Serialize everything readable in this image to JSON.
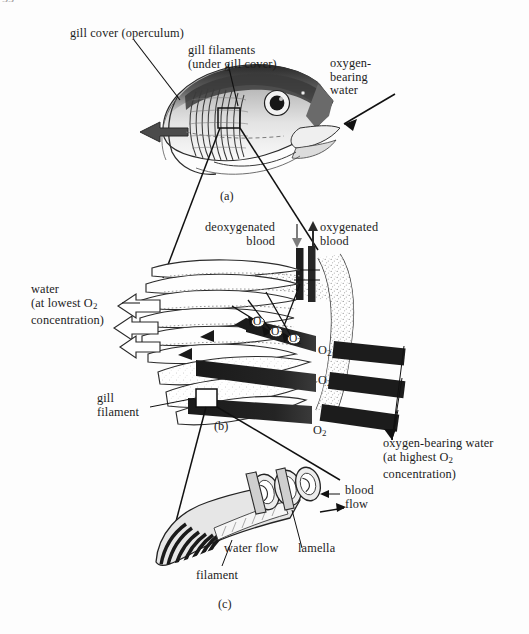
{
  "figure": {
    "page_artifact": "55",
    "background_color": "#fdfdfd",
    "ink_color": "#1a1a1a"
  },
  "panels": [
    {
      "id": "a",
      "caption": "(a)",
      "subject": "fish head with gill cover and gill filaments"
    },
    {
      "id": "b",
      "caption": "(b)",
      "subject": "gill arch with filaments and blood vessels"
    },
    {
      "id": "c",
      "caption": "(c)",
      "subject": "single gill filament with lamellae"
    }
  ],
  "labels": {
    "gill_cover": "gill cover (operculum)",
    "gill_filaments_a": "gill filaments\n(under gill cover)",
    "oxygen_bearing_water_a": "oxygen-\nbearing\nwater",
    "deoxygenated_blood": "deoxygenated\nblood",
    "oxygenated_blood": "oxygenated\nblood",
    "water_lowest": "water\n(at lowest O",
    "water_lowest_sub": "2",
    "water_lowest_tail": "concentration)",
    "gill_filament_b": "gill\nfilament",
    "oxygen_bearing_water_b": "oxygen-bearing water\n(at highest O",
    "oxygen_bearing_water_b_sub": "2",
    "oxygen_bearing_water_b_tail": "concentration)",
    "blood_flow": "blood\nflow",
    "water_flow": "water flow",
    "lamella": "lamella",
    "filament": "filament",
    "o2": "O",
    "o2_sub": "2"
  },
  "o2_markers": {
    "large": [
      {
        "x": 322,
        "y": 348
      },
      {
        "x": 322,
        "y": 377
      },
      {
        "x": 318,
        "y": 427
      }
    ],
    "small": [
      {
        "x": 257,
        "y": 320
      },
      {
        "x": 274,
        "y": 330
      },
      {
        "x": 292,
        "y": 337
      }
    ]
  }
}
